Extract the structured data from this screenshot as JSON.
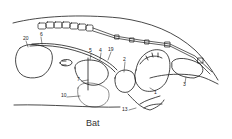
{
  "caption": "Bat",
  "labels": [
    {
      "id": "20",
      "text": "20",
      "x": 23,
      "y": 38
    },
    {
      "id": "6",
      "text": "6",
      "x": 40,
      "y": 34
    },
    {
      "id": "5",
      "text": "5",
      "x": 90,
      "y": 51
    },
    {
      "id": "4",
      "text": "4",
      "x": 100,
      "y": 50
    },
    {
      "id": "19",
      "text": "19",
      "x": 109,
      "y": 49
    },
    {
      "id": "2",
      "text": "2",
      "x": 124,
      "y": 59
    },
    {
      "id": "7",
      "text": "7",
      "x": 78,
      "y": 79
    },
    {
      "id": "10",
      "text": "10",
      "x": 62,
      "y": 95
    },
    {
      "id": "1",
      "text": "1",
      "x": 154,
      "y": 92
    },
    {
      "id": "13",
      "text": "13",
      "x": 123,
      "y": 109
    },
    {
      "id": "3",
      "text": "3",
      "x": 184,
      "y": 84
    }
  ],
  "colors": {
    "stroke": "#1a1a1a",
    "background": "#ffffff"
  }
}
